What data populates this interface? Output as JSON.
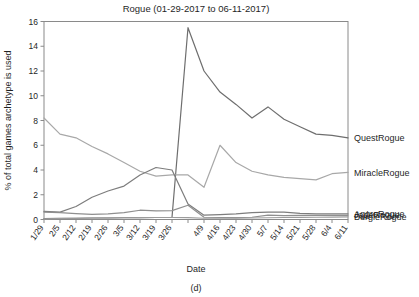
{
  "figure": {
    "caption": "(d)",
    "title": "Rogue (01-29-2017 to 06-11-2017)"
  },
  "chart_data": {
    "type": "line",
    "title": "Rogue (01-29-2017 to 06-11-2017)",
    "xlabel": "Date",
    "ylabel": "% of total games archetype is used",
    "ylim": [
      0,
      16
    ],
    "yticks": [
      0,
      2,
      4,
      6,
      8,
      10,
      12,
      14,
      16
    ],
    "grid": false,
    "legend_position": "right",
    "categories": [
      "1/29",
      "2/5",
      "2/12",
      "2/19",
      "2/26",
      "3/5",
      "3/12",
      "3/19",
      "3/26",
      "4/2",
      "4/9",
      "4/16",
      "4/23",
      "4/30",
      "5/7",
      "5/14",
      "5/21",
      "5/28",
      "6/4",
      "6/11"
    ],
    "xticklabels": [
      "1/29",
      "2/5",
      "2/12",
      "2/19",
      "2/26",
      "3/5",
      "3/12",
      "3/19",
      "3/26",
      "",
      "4/9",
      "4/16",
      "4/23",
      "4/30",
      "5/7",
      "5/14",
      "5/21",
      "5/28",
      "6/4",
      "6/11"
    ],
    "series": [
      {
        "name": "QuestRogue",
        "color": "#6e6e6e",
        "values": [
          0.08,
          0.1,
          0.1,
          0.12,
          0.12,
          0.14,
          0.15,
          0.16,
          0.18,
          15.5,
          12.0,
          10.3,
          9.3,
          8.2,
          9.1,
          8.1,
          7.5,
          6.9,
          6.8,
          6.6
        ]
      },
      {
        "name": "MiracleRogue",
        "color": "#a8a8a8",
        "values": [
          8.2,
          6.9,
          6.6,
          5.9,
          5.3,
          4.6,
          3.9,
          3.5,
          3.6,
          3.6,
          2.6,
          6.0,
          4.6,
          3.9,
          3.6,
          3.4,
          3.3,
          3.2,
          3.7,
          3.8
        ]
      },
      {
        "name": "AggroRogue",
        "color": "#7d7d7d",
        "values": [
          0.65,
          0.6,
          1.05,
          1.8,
          2.3,
          2.7,
          3.6,
          4.2,
          4.0,
          1.25,
          0.35,
          0.4,
          0.45,
          0.55,
          0.6,
          0.6,
          0.5,
          0.45,
          0.45,
          0.45
        ]
      },
      {
        "name": "JadeRogue",
        "color": "#8f8f8f",
        "values": [
          0.6,
          0.55,
          0.48,
          0.42,
          0.45,
          0.55,
          0.75,
          0.7,
          0.72,
          1.15,
          0.18,
          0.16,
          0.15,
          0.18,
          0.35,
          0.32,
          0.33,
          0.34,
          0.34,
          0.34
        ]
      },
      {
        "name": "BurgleRogue",
        "color": "#9c9c9c",
        "values": [
          0.05,
          0.08,
          0.1,
          0.12,
          0.13,
          0.14,
          0.15,
          0.16,
          0.16,
          0.15,
          0.1,
          0.1,
          0.11,
          0.12,
          0.14,
          0.16,
          0.17,
          0.18,
          0.2,
          0.22
        ]
      }
    ]
  }
}
